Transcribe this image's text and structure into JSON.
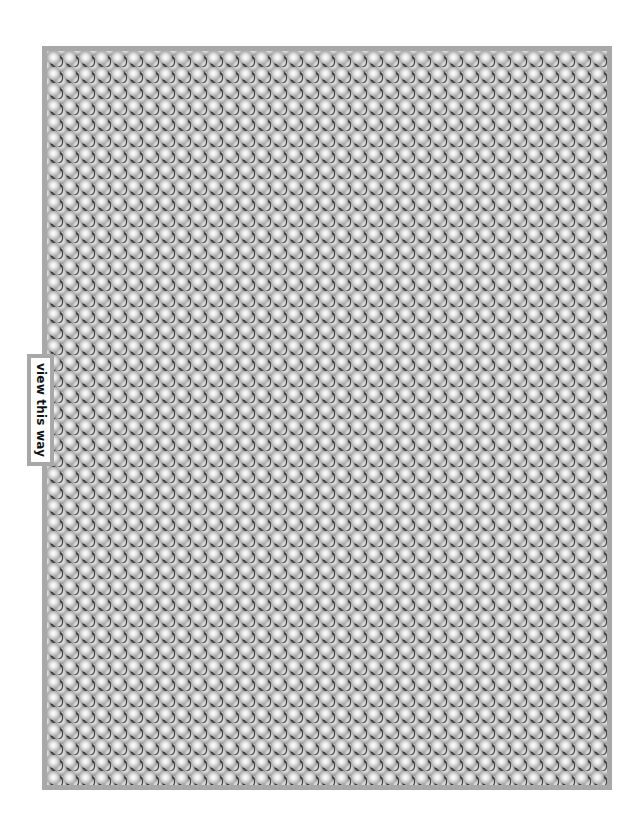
{
  "figure": {
    "type": "autostereogram",
    "label": "view this way",
    "colors": {
      "frame": "#a8a8a8",
      "texture_base": "#bdbdbd",
      "highlight": "#ffffff",
      "shadow": "#2e2e2e",
      "label_bg": "#ffffff",
      "label_text": "#111111"
    }
  }
}
